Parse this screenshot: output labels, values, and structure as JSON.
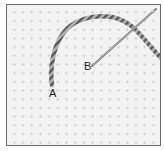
{
  "figure": {
    "labels": {
      "a": "A",
      "b": "B"
    },
    "colors": {
      "fabric": "#f2f2f2",
      "fabric_holes": "#c9c9c9",
      "thread_dark": "#5a5a5a",
      "thread_light": "#b5b5b5",
      "needle": "#8a8a8a",
      "border": "#6a6a6a"
    }
  }
}
